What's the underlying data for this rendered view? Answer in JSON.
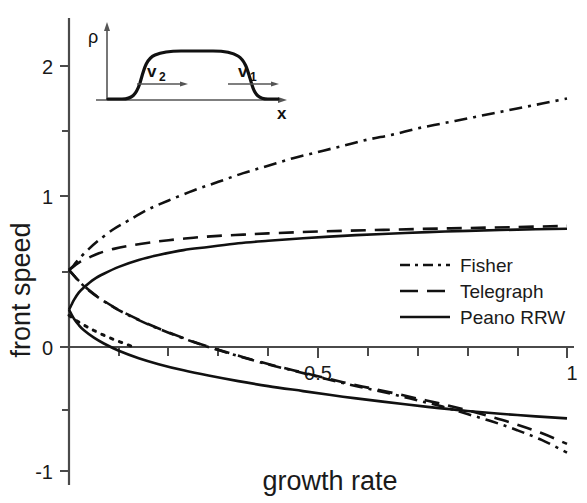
{
  "figure": {
    "background": "#ffffff",
    "ink_color": "#111111",
    "axis_color": "#4a4a4a"
  },
  "axes": {
    "xlabel": "growth rate",
    "ylabel": "front speed",
    "x_ticklabels": [
      "0.5",
      "1"
    ],
    "x_tickvalues": [
      0.5,
      1.0
    ],
    "y_ticklabels": [
      "2",
      "1",
      "0",
      "-1"
    ],
    "y_tickvalues": [
      2,
      1,
      0,
      -1
    ],
    "x_minor_ticks": [
      0.1,
      0.2,
      0.3,
      0.4,
      0.6,
      0.7,
      0.8,
      0.9
    ],
    "y_minor_ticks": [
      1.5,
      0.5,
      -0.5
    ],
    "xlim": [
      0,
      1
    ],
    "ylim": [
      -1,
      2.35
    ],
    "grid": "off"
  },
  "inset": {
    "ylabel": "ρ",
    "xlabel": "x",
    "arrow_left_label": "v",
    "arrow_left_sub": "2",
    "arrow_right_label": "v",
    "arrow_right_sub": "1",
    "description": "plateau pulse profile with two outward front velocities"
  },
  "legend": {
    "position": "center-right",
    "items": [
      {
        "label": "Fisher",
        "style": "dash-dot"
      },
      {
        "label": "Telegraph",
        "style": "dashed"
      },
      {
        "label": "Peano RRW",
        "style": "solid"
      }
    ]
  },
  "chart_data": {
    "type": "line",
    "title": "",
    "xlabel": "growth rate",
    "ylabel": "front speed",
    "xlim": [
      0,
      1
    ],
    "ylim": [
      -1,
      2.35
    ],
    "xticks": [
      0.5,
      1
    ],
    "yticks": [
      2,
      1,
      0,
      -1
    ],
    "grid": false,
    "legend_position": "center-right",
    "note": "Each model has an upper (forward front, v1) and lower (backward front, v2) branch emanating from the same point near the vertical axis.",
    "series": [
      {
        "name": "Fisher",
        "style": "dash-dot",
        "branch": "upper",
        "x": [
          0.0,
          0.01,
          0.02,
          0.04,
          0.06,
          0.09,
          0.12,
          0.16,
          0.2,
          0.25,
          0.3,
          0.35,
          0.4,
          0.45,
          0.5,
          0.55,
          0.6,
          0.65,
          0.7,
          0.75,
          0.8,
          0.85,
          0.9,
          0.95,
          1.0
        ],
        "y": [
          0.62,
          0.66,
          0.71,
          0.79,
          0.86,
          0.95,
          1.02,
          1.11,
          1.18,
          1.26,
          1.33,
          1.4,
          1.46,
          1.52,
          1.57,
          1.62,
          1.67,
          1.71,
          1.76,
          1.8,
          1.84,
          1.88,
          1.92,
          1.96,
          2.0
        ]
      },
      {
        "name": "Telegraph",
        "style": "dashed",
        "branch": "upper",
        "x": [
          0.0,
          0.01,
          0.02,
          0.04,
          0.06,
          0.09,
          0.12,
          0.16,
          0.2,
          0.25,
          0.3,
          0.35,
          0.4,
          0.5,
          0.6,
          0.7,
          0.8,
          0.9,
          1.0
        ],
        "y": [
          0.62,
          0.65,
          0.68,
          0.72,
          0.755,
          0.79,
          0.815,
          0.84,
          0.86,
          0.88,
          0.895,
          0.905,
          0.915,
          0.93,
          0.94,
          0.95,
          0.958,
          0.966,
          0.975
        ]
      },
      {
        "name": "Peano RRW",
        "style": "solid",
        "branch": "upper",
        "x": [
          0.0,
          0.005,
          0.01,
          0.02,
          0.03,
          0.05,
          0.07,
          0.1,
          0.14,
          0.18,
          0.23,
          0.28,
          0.34,
          0.4,
          0.47,
          0.55,
          0.63,
          0.72,
          0.8,
          0.9,
          1.0
        ],
        "y": [
          0.3,
          0.34,
          0.38,
          0.44,
          0.48,
          0.545,
          0.59,
          0.645,
          0.7,
          0.74,
          0.78,
          0.805,
          0.835,
          0.855,
          0.875,
          0.895,
          0.91,
          0.925,
          0.935,
          0.945,
          0.952
        ]
      },
      {
        "name": "Fisher",
        "style": "dash-dot",
        "branch": "lower",
        "x": [
          0.0,
          0.01,
          0.02,
          0.04,
          0.06,
          0.09,
          0.12,
          0.16,
          0.2,
          0.25,
          0.3,
          0.35,
          0.4,
          0.45,
          0.5,
          0.55,
          0.6,
          0.65,
          0.7,
          0.75,
          0.8,
          0.85,
          0.9,
          0.95,
          1.0
        ],
        "y": [
          0.62,
          0.575,
          0.53,
          0.455,
          0.395,
          0.32,
          0.255,
          0.18,
          0.115,
          0.04,
          -0.025,
          -0.085,
          -0.14,
          -0.19,
          -0.24,
          -0.29,
          -0.335,
          -0.38,
          -0.43,
          -0.48,
          -0.54,
          -0.6,
          -0.67,
          -0.75,
          -0.85
        ]
      },
      {
        "name": "Telegraph",
        "style": "dashed",
        "branch": "lower",
        "x": [
          0.0,
          0.01,
          0.02,
          0.04,
          0.06,
          0.09,
          0.12,
          0.16,
          0.2,
          0.25,
          0.3,
          0.35,
          0.4,
          0.45,
          0.5,
          0.55,
          0.6,
          0.65,
          0.7,
          0.75,
          0.8,
          0.85,
          0.9,
          0.95,
          1.0
        ],
        "y": [
          0.62,
          0.575,
          0.532,
          0.458,
          0.398,
          0.322,
          0.258,
          0.183,
          0.118,
          0.043,
          -0.022,
          -0.082,
          -0.137,
          -0.187,
          -0.235,
          -0.283,
          -0.327,
          -0.37,
          -0.415,
          -0.46,
          -0.51,
          -0.565,
          -0.625,
          -0.695,
          -0.78
        ]
      },
      {
        "name": "Peano RRW",
        "style": "solid",
        "branch": "lower",
        "x": [
          0.0,
          0.005,
          0.01,
          0.02,
          0.03,
          0.05,
          0.07,
          0.1,
          0.14,
          0.18,
          0.23,
          0.28,
          0.34,
          0.4,
          0.47,
          0.55,
          0.63,
          0.72,
          0.8,
          0.9,
          1.0
        ],
        "y": [
          0.3,
          0.262,
          0.228,
          0.175,
          0.135,
          0.075,
          0.028,
          -0.03,
          -0.09,
          -0.138,
          -0.188,
          -0.23,
          -0.275,
          -0.315,
          -0.355,
          -0.4,
          -0.44,
          -0.482,
          -0.515,
          -0.548,
          -0.575
        ]
      },
      {
        "name": "Peano RRW initial dotted segment",
        "style": "dotted",
        "branch": "lower-tail",
        "x": [
          0.0,
          0.01,
          0.02,
          0.035,
          0.05,
          0.07,
          0.09,
          0.11,
          0.13
        ],
        "y": [
          0.255,
          0.225,
          0.2,
          0.165,
          0.133,
          0.095,
          0.06,
          0.03,
          0.0
        ]
      }
    ]
  }
}
